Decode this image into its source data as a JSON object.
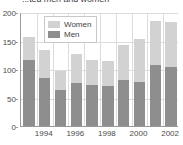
{
  "chart_data": {
    "type": "bar",
    "subtype": "stacked-bar",
    "title": "...ted men and women",
    "xlabel": "",
    "ylabel": "",
    "ylim": [
      0,
      200
    ],
    "yticks": [
      0,
      50,
      100,
      150,
      200
    ],
    "grid": true,
    "legend_position": "top-left-inside",
    "categories": [
      "1993",
      "1994",
      "1995",
      "1996",
      "1997",
      "1998",
      "1999",
      "2000",
      "2001",
      "2002"
    ],
    "tick_labels": [
      "",
      "1994",
      "",
      "1996",
      "",
      "1998",
      "",
      "2000",
      "",
      "2002"
    ],
    "series": [
      {
        "name": "Men",
        "color": "#8e8e8e",
        "values": [
          115,
          85,
          63,
          75,
          72,
          70,
          81,
          77,
          107,
          103
        ]
      },
      {
        "name": "Women",
        "color": "#d2d2d2",
        "values": [
          41,
          48,
          34,
          51,
          44,
          44,
          62,
          76,
          78,
          79
        ]
      }
    ],
    "totals": [
      156,
      133,
      97,
      126,
      116,
      114,
      143,
      153,
      185,
      182
    ]
  },
  "legend": {
    "items": [
      {
        "label": "Women",
        "color": "#d2d2d2"
      },
      {
        "label": "Men",
        "color": "#8e8e8e"
      }
    ]
  },
  "axes": {
    "y_tick_labels": [
      "200",
      "150",
      "100",
      "50",
      "0"
    ],
    "x_tick_labels": [
      "1994",
      "1996",
      "1998",
      "2000",
      "2002"
    ]
  },
  "colors": {
    "women": "#d2d2d2",
    "men": "#8e8e8e",
    "axis": "#9a9a9a",
    "grid": "#dcdcdc",
    "text": "#3f3f3f",
    "background": "#ffffff"
  }
}
